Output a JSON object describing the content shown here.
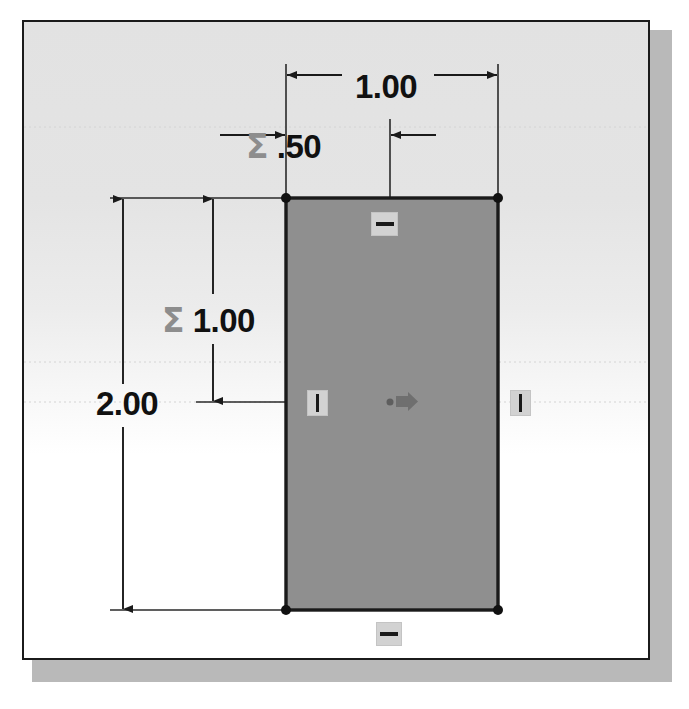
{
  "app": {
    "view": "sketch-canvas",
    "background_color": "#ffffff",
    "canvas_fill_top": "#e2e2e2",
    "canvas_fill_bottom": "#ffffff",
    "canvas_border_color": "#1b1b1b",
    "shadow_color": "#b9b9b9"
  },
  "sketch": {
    "shape": "rectangle",
    "fill_color": "#8f8f8f",
    "edge_color": "#1a1a1a",
    "vertex_color": "#111111",
    "origin_marker_color": "#6a6a6a",
    "construction_line_color": "#2a2a2a",
    "rect": {
      "x": 262,
      "y": 176,
      "width": 212,
      "height": 412
    },
    "origin": {
      "x": 366,
      "y": 380
    }
  },
  "dimensions": [
    {
      "id": "width",
      "label": "1.00",
      "value": "1.00",
      "driven_symbol": "",
      "orientation": "horizontal",
      "placement": "above-top-edge"
    },
    {
      "id": "half-width",
      "label": "Σ .50",
      "sigma": "Σ",
      "value": ".50",
      "driven_symbol": "Σ",
      "orientation": "horizontal",
      "placement": "above-top-edge-inner"
    },
    {
      "id": "height-sigma",
      "label": "Σ 1.00",
      "sigma": "Σ",
      "value": "1.00",
      "driven_symbol": "Σ",
      "orientation": "vertical",
      "placement": "left-inner"
    },
    {
      "id": "height",
      "label": "2.00",
      "value": "2.00",
      "driven_symbol": "",
      "orientation": "vertical",
      "placement": "left-outer"
    }
  ],
  "constraints": [
    {
      "id": "top-horizontal",
      "type": "horizontal",
      "glyph": "horizontal-bar"
    },
    {
      "id": "left-vertical",
      "type": "vertical",
      "glyph": "vertical-bar"
    },
    {
      "id": "right-vertical",
      "type": "vertical",
      "glyph": "vertical-bar"
    },
    {
      "id": "bottom-horizontal",
      "type": "horizontal",
      "glyph": "horizontal-bar"
    }
  ]
}
